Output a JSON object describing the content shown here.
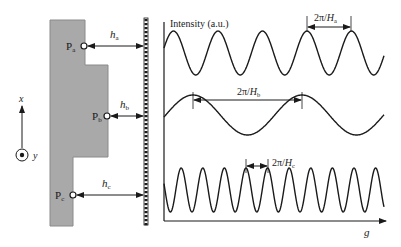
{
  "colors": {
    "shape_fill": "#a9a9a9",
    "shape_stroke": "#8a8a8a",
    "ink": "#1a1a1a",
    "background": "#ffffff"
  },
  "left_panel": {
    "points": [
      {
        "name": "P",
        "sub": "a"
      },
      {
        "name": "P",
        "sub": "b"
      },
      {
        "name": "P",
        "sub": "c"
      }
    ],
    "distances": [
      {
        "name": "h",
        "sub": "a"
      },
      {
        "name": "h",
        "sub": "b"
      },
      {
        "name": "h",
        "sub": "c"
      }
    ],
    "axes": {
      "x_label": "x",
      "y_label": "y"
    }
  },
  "right_panel": {
    "y_axis_label": "Intensity (a.u.)",
    "x_axis_label": "g",
    "period_labels": [
      {
        "prefix": "2π/",
        "name": "H",
        "sub": "a"
      },
      {
        "prefix": "2π/",
        "name": "H",
        "sub": "b"
      },
      {
        "prefix": "2π/",
        "name": "H",
        "sub": "c"
      }
    ]
  }
}
